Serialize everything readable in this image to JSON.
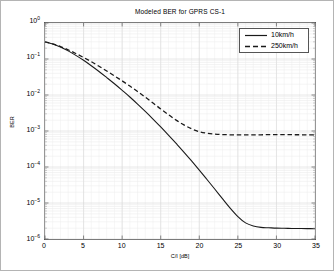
{
  "figure": {
    "width": 334,
    "height": 271,
    "background": "#ffffff",
    "border_color": "#b4b4b4"
  },
  "chart_data": {
    "type": "line",
    "title": "Modeled BER for GPRS CS-1",
    "xlabel": "C/I [dB]",
    "ylabel": "BER",
    "xscale": "linear",
    "yscale": "log",
    "xlim": [
      0,
      35
    ],
    "ylim": [
      1e-06,
      1
    ],
    "grid": true,
    "grid_minor": true,
    "grid_color": "#d8d8d8",
    "axis_color": "#555555",
    "legend_position": "upper right",
    "xticks": [
      0,
      5,
      10,
      15,
      20,
      25,
      30,
      35
    ],
    "xtick_labels": [
      "0",
      "5",
      "10",
      "15",
      "20",
      "25",
      "30",
      "35"
    ],
    "yticks": [
      1,
      0.1,
      0.01,
      0.001,
      0.0001,
      1e-05,
      1e-06
    ],
    "ytick_labels": [
      "10^0",
      "10^-1",
      "10^-2",
      "10^-3",
      "10^-4",
      "10^-5",
      "10^-6"
    ],
    "ytick_mantissa": [
      "10",
      "10",
      "10",
      "10",
      "10",
      "10",
      "10"
    ],
    "ytick_exponent": [
      "0",
      "-1",
      "-2",
      "-3",
      "-4",
      "-5",
      "-6"
    ],
    "x": [
      0,
      1,
      2,
      3,
      4,
      5,
      6,
      7,
      8,
      9,
      10,
      11,
      12,
      13,
      14,
      15,
      16,
      17,
      18,
      19,
      20,
      21,
      22,
      23,
      24,
      25,
      26,
      27,
      28,
      29,
      30,
      31,
      32,
      33,
      34,
      35
    ],
    "series": [
      {
        "name": "10km/h",
        "style": "solid",
        "color": "#1a1a1a",
        "width": 1.1,
        "values": [
          0.3,
          0.26,
          0.215,
          0.168,
          0.126,
          0.092,
          0.065,
          0.045,
          0.0305,
          0.0205,
          0.0135,
          0.0088,
          0.0056,
          0.0035,
          0.00215,
          0.0013,
          0.00077,
          0.00045,
          0.00026,
          0.000147,
          8.2e-05,
          4.5e-05,
          2.45e-05,
          1.32e-05,
          7.2e-06,
          4.2e-06,
          2.8e-06,
          2.3e-06,
          2.1e-06,
          2.05e-06,
          2e-06,
          1.98e-06,
          1.96e-06,
          1.95e-06,
          1.94e-06,
          1.93e-06
        ]
      },
      {
        "name": "250km/h",
        "style": "dashed",
        "color": "#1a1a1a",
        "width": 1.3,
        "values": [
          0.3,
          0.262,
          0.222,
          0.18,
          0.142,
          0.11,
          0.084,
          0.063,
          0.0465,
          0.034,
          0.0247,
          0.0177,
          0.0125,
          0.0087,
          0.006,
          0.0041,
          0.00285,
          0.002,
          0.00148,
          0.00115,
          0.00096,
          0.00087,
          0.00082,
          0.000795,
          0.000785,
          0.00078,
          0.00078,
          0.000782,
          0.000785,
          0.00079,
          0.00079,
          0.00079,
          0.000788,
          0.000786,
          0.000785,
          0.000785
        ]
      }
    ],
    "legend": [
      {
        "label": "10km/h",
        "style": "solid"
      },
      {
        "label": "250km/h",
        "style": "dashed"
      }
    ]
  }
}
